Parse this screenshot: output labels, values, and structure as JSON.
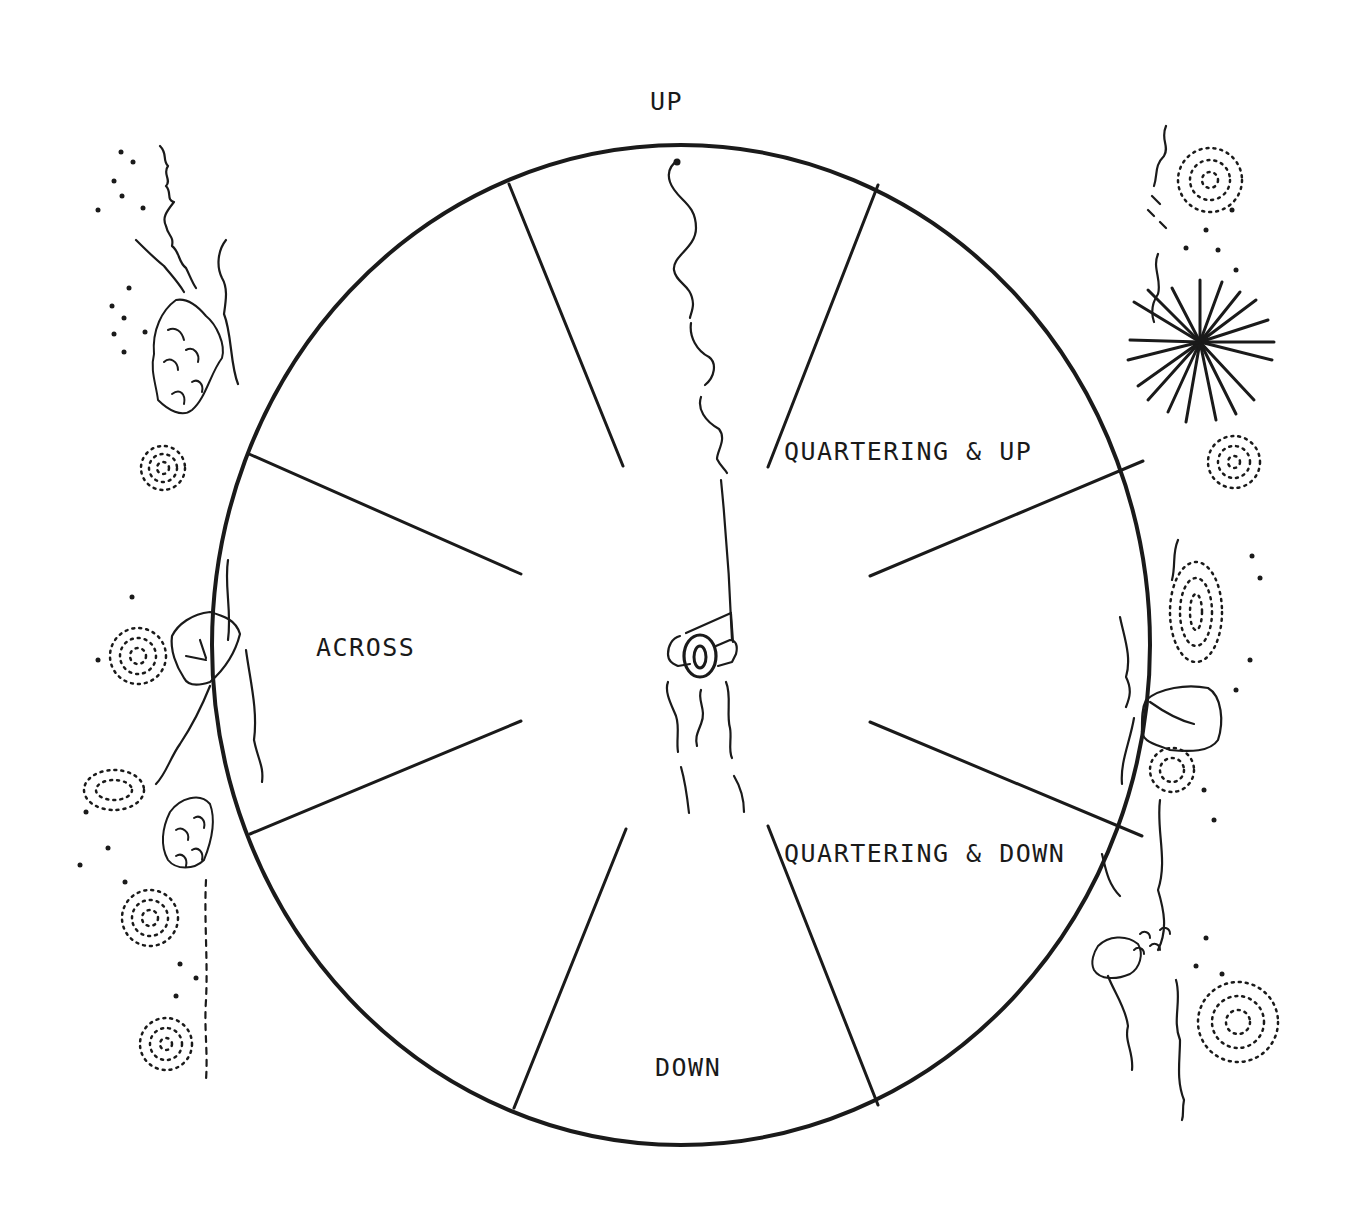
{
  "diagram": {
    "labels": {
      "up": "UP",
      "quartering_up": "QUARTERING & UP",
      "across": "ACROSS",
      "quartering_down": "QUARTERING & DOWN",
      "down": "DOWN"
    },
    "center_figure": {
      "icon": "angler-icon",
      "number": "0"
    },
    "colors": {
      "ink": "#1a1a1a",
      "paper": "#ffffff"
    }
  }
}
